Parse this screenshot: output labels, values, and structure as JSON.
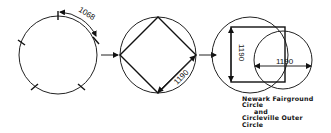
{
  "diagram": {
    "step1": {
      "dimension_label": "1068"
    },
    "step2": {
      "dimension_label": "1190"
    },
    "step3": {
      "vertical_dimension_label": "1190",
      "horizontal_dimension_label": "1190"
    },
    "caption": {
      "line1": "Newark Fairground",
      "line2": "Circle",
      "line3": "and",
      "line4": "Circleville Outer",
      "line5": "Circle"
    }
  }
}
